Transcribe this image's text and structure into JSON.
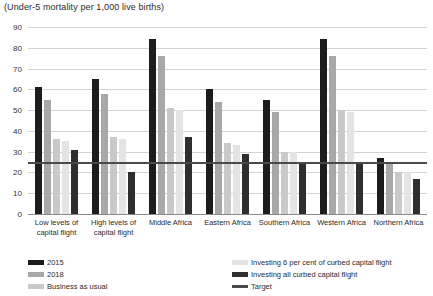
{
  "chart_data": {
    "type": "bar",
    "title": "(Under-5 mortality per 1,000 live births)",
    "xlabel": "",
    "ylabel": "",
    "ylim": [
      0,
      90
    ],
    "ytick_values": [
      0,
      10,
      20,
      30,
      40,
      50,
      60,
      70,
      80,
      90
    ],
    "ytick_labels": [
      "0",
      "10",
      "20",
      "30",
      "40",
      "50",
      "60",
      "70",
      "80",
      "90"
    ],
    "grid": true,
    "legend_position": "bottom",
    "categories": [
      "Low levels of capital flight",
      "High levels of capital flight",
      "Middle Africa",
      "Eastern Africa",
      "Southern Africa",
      "Western Africa",
      "Northern Africa"
    ],
    "category_lines": [
      [
        "Low levels of",
        "capital flight"
      ],
      [
        "High levels of",
        "capital flight"
      ],
      [
        "Middle Africa"
      ],
      [
        "Eastern Africa"
      ],
      [
        "Southern Africa"
      ],
      [
        "Western Africa"
      ],
      [
        "Northern Africa"
      ]
    ],
    "series": [
      {
        "name": "2015",
        "color": "#1c1c1c",
        "values": [
          61,
          65,
          84,
          60,
          55,
          84,
          27
        ]
      },
      {
        "name": "2018",
        "color": "#a8a8a8",
        "values": [
          55,
          58,
          76,
          54,
          49,
          76,
          25
        ]
      },
      {
        "name": "Business as usual",
        "color": "#c9c9c9",
        "values": [
          36,
          37,
          51,
          34,
          30,
          50,
          20
        ]
      },
      {
        "name": "Investing 6 per cent of curbed capital flight",
        "color": "#e4e4e4",
        "values": [
          35,
          36,
          50,
          33,
          30,
          49,
          20
        ]
      },
      {
        "name": "Investing all curbed capital flight",
        "color": "#2e2e2e",
        "values": [
          31,
          20,
          37,
          29,
          25,
          25,
          17
        ]
      }
    ],
    "target": {
      "name": "Target",
      "value": 25,
      "color": "#4a4a4a"
    },
    "legend_entries": [
      {
        "name": "2015",
        "color": "#1c1c1c",
        "kind": "swatch"
      },
      {
        "name": "2018",
        "color": "#a8a8a8",
        "kind": "swatch"
      },
      {
        "name": "Business as usual",
        "color": "#c9c9c9",
        "kind": "swatch"
      },
      {
        "name": "Investing 6 per cent of curbed capital flight",
        "color": "#e4e4e4",
        "kind": "swatch"
      },
      {
        "name": "Investing all curbed capital flight",
        "color": "#2e2e2e",
        "kind": "swatch"
      },
      {
        "name": "Target",
        "color": "#4a4a4a",
        "kind": "line"
      }
    ]
  }
}
